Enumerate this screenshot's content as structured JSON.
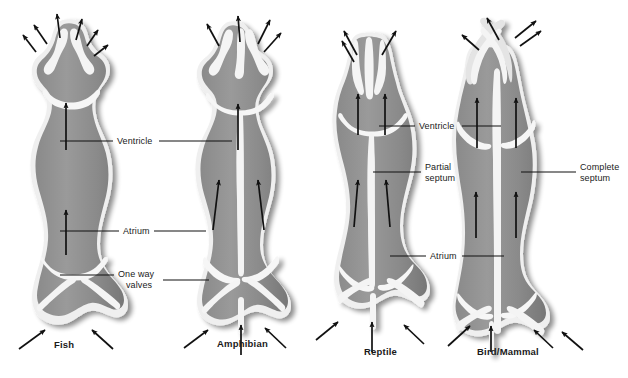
{
  "figure": {
    "background_color": "#ffffff"
  },
  "palette": {
    "muscle_fill": "#8e8e8e",
    "muscle_fill_dark": "#7d7d7d",
    "lumen_light": "#d9d9d9",
    "outline_white": "#f2f2f2",
    "shadow": "#c9c9c9",
    "arrow": "#111111",
    "leader_line": "#111111",
    "text": "#1a1a1a"
  },
  "labels": [
    {
      "id": "ventricle-left",
      "text": "Ventricle",
      "x": 117,
      "y": 136,
      "bold": false
    },
    {
      "id": "atrium-left",
      "text": "Atrium",
      "x": 123,
      "y": 226,
      "bold": false
    },
    {
      "id": "one-way-line1",
      "text": "One way",
      "x": 118,
      "y": 269,
      "bold": false
    },
    {
      "id": "one-way-line2",
      "text": "valves",
      "x": 126,
      "y": 280,
      "bold": false
    },
    {
      "id": "ventricle-right",
      "text": "Ventricle",
      "x": 419,
      "y": 121,
      "bold": false
    },
    {
      "id": "partial-line1",
      "text": "Partial",
      "x": 425,
      "y": 162,
      "bold": false
    },
    {
      "id": "partial-line2",
      "text": "septum",
      "x": 425,
      "y": 173,
      "bold": false
    },
    {
      "id": "complete-line1",
      "text": "Complete",
      "x": 580,
      "y": 162,
      "bold": false
    },
    {
      "id": "complete-line2",
      "text": "septum",
      "x": 580,
      "y": 173,
      "bold": false
    },
    {
      "id": "atrium-right",
      "text": "Atrium",
      "x": 430,
      "y": 251,
      "bold": false
    }
  ],
  "specimen_labels": [
    {
      "id": "fish",
      "text": "Fish",
      "x": 54,
      "y": 339
    },
    {
      "id": "amphibian",
      "text": "Amphibian",
      "x": 217,
      "y": 338
    },
    {
      "id": "reptile",
      "text": "Reptile",
      "x": 364,
      "y": 346
    },
    {
      "id": "bird-mammal",
      "text": "Bird/Mammal",
      "x": 477,
      "y": 346
    }
  ],
  "hearts": [
    {
      "id": "fish-heart",
      "name": "Fish",
      "chambers": [
        "Ventricle",
        "Atrium"
      ],
      "septum": "none",
      "outflow_arrows": 5,
      "inflow_arrows": 2,
      "internal_arrows": 2
    },
    {
      "id": "amphibian-heart",
      "name": "Amphibian",
      "chambers": [
        "Ventricle",
        "Atrium (two)"
      ],
      "septum": "none",
      "outflow_arrows": 3,
      "inflow_arrows": 3,
      "internal_arrows": 3
    },
    {
      "id": "reptile-heart",
      "name": "Reptile",
      "chambers": [
        "Ventricle",
        "Atrium (two)"
      ],
      "septum": "Partial septum",
      "outflow_arrows": 2,
      "inflow_arrows": 3,
      "internal_arrows": 2
    },
    {
      "id": "bird-mammal-heart",
      "name": "Bird/Mammal",
      "chambers": [
        "Ventricle (two)",
        "Atrium (two)"
      ],
      "septum": "Complete septum",
      "outflow_arrows": 3,
      "inflow_arrows": 4,
      "internal_arrows": 2
    }
  ],
  "leader_lines": [
    {
      "id": "ventricle-left-leader-a",
      "x1": 60,
      "y1": 141,
      "x2": 113,
      "y2": 141
    },
    {
      "id": "ventricle-left-leader-b",
      "x1": 159,
      "y1": 141,
      "x2": 230,
      "y2": 141
    },
    {
      "id": "atrium-left-leader-a",
      "x1": 60,
      "y1": 231,
      "x2": 119,
      "y2": 231
    },
    {
      "id": "atrium-left-leader-b",
      "x1": 154,
      "y1": 231,
      "x2": 204,
      "y2": 231
    },
    {
      "id": "one-way-leader-a",
      "x1": 60,
      "y1": 275,
      "x2": 113,
      "y2": 275
    },
    {
      "id": "one-way-leader-b",
      "x1": 162,
      "y1": 280,
      "x2": 208,
      "y2": 280
    },
    {
      "id": "ventricle-right-leader-a",
      "x1": 379,
      "y1": 126,
      "x2": 415,
      "y2": 126
    },
    {
      "id": "ventricle-right-leader-b",
      "x1": 462,
      "y1": 126,
      "x2": 500,
      "y2": 126
    },
    {
      "id": "partial-leader",
      "x1": 373,
      "y1": 172,
      "x2": 421,
      "y2": 172
    },
    {
      "id": "complete-leader",
      "x1": 521,
      "y1": 172,
      "x2": 576,
      "y2": 172
    },
    {
      "id": "atrium-right-leader-a",
      "x1": 390,
      "y1": 256,
      "x2": 426,
      "y2": 256
    },
    {
      "id": "atrium-right-leader-b",
      "x1": 462,
      "y1": 256,
      "x2": 503,
      "y2": 256
    }
  ]
}
